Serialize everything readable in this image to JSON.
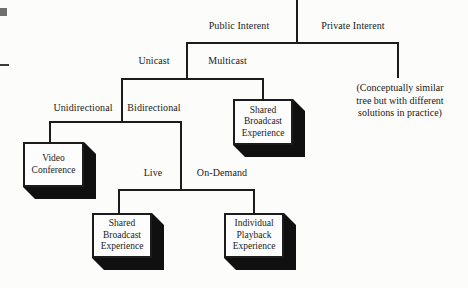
{
  "colors": {
    "background": "#fcfcfb",
    "line": "#1c1c1c",
    "text": "#1a1a1a",
    "box_face": "#fdfdfd",
    "box_shadow": "#101010"
  },
  "tree": {
    "root_branches": {
      "left": "Public Interent",
      "right": "Private Interent"
    },
    "public_branches": {
      "left": "Unicast",
      "right": "Multicast"
    },
    "unicast_branches": {
      "left": "Unidirectional",
      "right": "Bidirectional"
    },
    "bidirectional_branches": {
      "left": "Live",
      "right": "On-Demand"
    },
    "leaf_boxes": {
      "unidirectional": {
        "line1": "Video",
        "line2": "Conference"
      },
      "multicast": {
        "line1": "Shared",
        "line2": "Broadcast",
        "line3": "Experience"
      },
      "live": {
        "line1": "Shared",
        "line2": "Broadcast",
        "line3": "Experience"
      },
      "on_demand": {
        "line1": "Individual",
        "line2": "Playback",
        "line3": "Experience"
      }
    },
    "private_note": {
      "line1": "(Conceptually similar",
      "line2": "tree but with different",
      "line3": "solutions in practice)"
    }
  }
}
